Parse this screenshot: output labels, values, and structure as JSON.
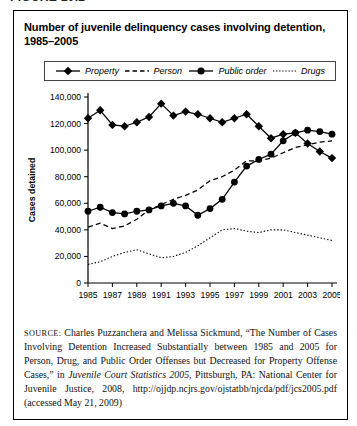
{
  "page": {
    "figure_label": "FIGURE 10.2"
  },
  "figure": {
    "title": "Number of juvenile delinquency cases involving detention, 1985–2005",
    "source": {
      "label": "SOURCE:",
      "text_before_italic": " Charles Puzzanchera and Melissa Sickmund, “The Number of Cases Involving Detention Increased Substantially between 1985 and 2005 for Person, Drug, and Public Order Offenses but Decreased for Property Offense Cases,” in ",
      "italic_text": "Juvenile Court Statistics 2005",
      "text_after_italic": ", Pittsburgh, PA: National Center for Juvenile Justice, 2008, http://ojjdp.ncjrs.gov/ojstatbb/njcda/pdf/jcs2005.pdf (accessed May 21, 2009)"
    }
  },
  "chart_data": {
    "type": "line",
    "title": "Number of juvenile delinquency cases involving detention, 1985–2005",
    "ylabel": "Cases detained",
    "xlabel": "",
    "ylim": [
      0,
      140000
    ],
    "yticks": [
      0,
      20000,
      40000,
      60000,
      80000,
      100000,
      120000,
      140000
    ],
    "xticks": [
      1985,
      1987,
      1989,
      1991,
      1993,
      1995,
      1997,
      1999,
      2001,
      2003,
      2005
    ],
    "grid": false,
    "legend_position": "top",
    "line_color": "#000000",
    "x": [
      1985,
      1986,
      1987,
      1988,
      1989,
      1990,
      1991,
      1992,
      1993,
      1994,
      1995,
      1996,
      1997,
      1998,
      1999,
      2000,
      2001,
      2002,
      2003,
      2004,
      2005
    ],
    "series": [
      {
        "name": "Property",
        "marker": "diamond",
        "line": "solid",
        "values": [
          124000,
          130000,
          119000,
          118000,
          121000,
          125000,
          135000,
          126000,
          129000,
          127000,
          124000,
          121000,
          124000,
          127000,
          118000,
          109000,
          112000,
          113000,
          105000,
          99000,
          94000
        ]
      },
      {
        "name": "Person",
        "marker": "none",
        "line": "dashed",
        "values": [
          42000,
          45000,
          41000,
          43000,
          48000,
          55000,
          59000,
          63000,
          66000,
          70000,
          77000,
          80000,
          85000,
          92000,
          92000,
          94000,
          98000,
          102000,
          104000,
          106000,
          107000
        ]
      },
      {
        "name": "Public order",
        "marker": "circle",
        "line": "solid",
        "values": [
          54000,
          57000,
          53000,
          52000,
          54000,
          55000,
          58000,
          60000,
          58000,
          51000,
          56000,
          63000,
          76000,
          88000,
          93000,
          97000,
          107000,
          113000,
          115000,
          114000,
          112000
        ]
      },
      {
        "name": "Drugs",
        "marker": "none",
        "line": "dotted",
        "values": [
          14000,
          16000,
          20000,
          23000,
          25000,
          22000,
          19000,
          20000,
          23000,
          28000,
          34000,
          40000,
          41000,
          39000,
          38000,
          40000,
          40000,
          38000,
          36000,
          34000,
          32000
        ]
      }
    ]
  }
}
